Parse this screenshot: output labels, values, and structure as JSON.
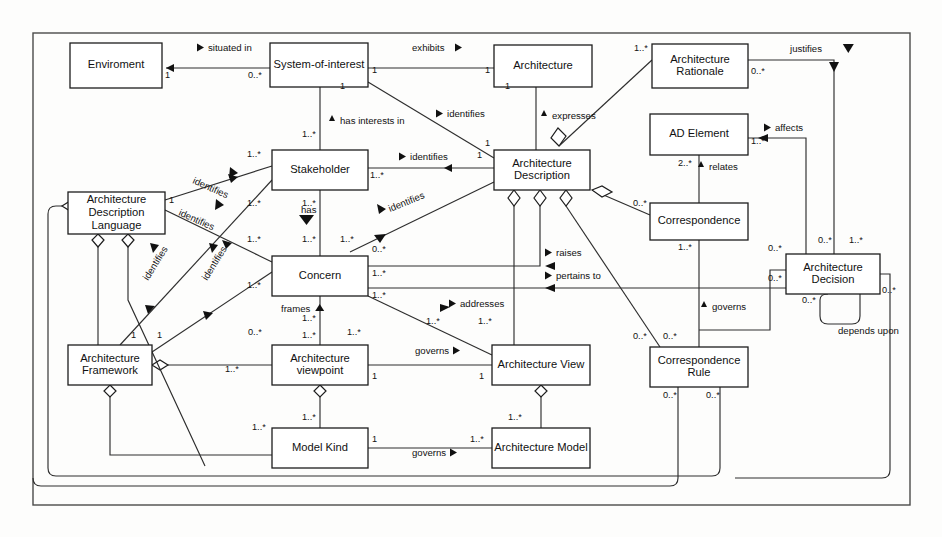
{
  "diagram": {
    "type": "uml-class-diagram",
    "frame": {
      "x": 33,
      "y": 33,
      "width": 877,
      "height": 472
    },
    "nodes": [
      {
        "id": "environment",
        "label": "Enviroment",
        "x": 70,
        "y": 43,
        "w": 92,
        "h": 45
      },
      {
        "id": "soi",
        "label": "System-of-interest",
        "x": 270,
        "y": 43,
        "w": 98,
        "h": 44
      },
      {
        "id": "architecture",
        "label": "Architecture",
        "x": 494,
        "y": 45,
        "w": 98,
        "h": 42
      },
      {
        "id": "arch-rationale",
        "label": "Architecture\nRationale",
        "x": 652,
        "y": 44,
        "w": 96,
        "h": 44
      },
      {
        "id": "ad-element",
        "label": "AD Element",
        "x": 650,
        "y": 114,
        "w": 98,
        "h": 41
      },
      {
        "id": "stakeholder",
        "label": "Stakeholder",
        "x": 272,
        "y": 150,
        "w": 96,
        "h": 40
      },
      {
        "id": "arch-description",
        "label": "Architecture\nDescription",
        "x": 494,
        "y": 150,
        "w": 96,
        "h": 40
      },
      {
        "id": "adl",
        "label": "Architecture\nDescription\nLanguage",
        "x": 68,
        "y": 192,
        "w": 97,
        "h": 42
      },
      {
        "id": "correspondence",
        "label": "Correspondence",
        "x": 650,
        "y": 203,
        "w": 98,
        "h": 37
      },
      {
        "id": "concern",
        "label": "Concern",
        "x": 272,
        "y": 256,
        "w": 96,
        "h": 40
      },
      {
        "id": "arch-decision",
        "label": "Architecture\nDecision",
        "x": 786,
        "y": 254,
        "w": 94,
        "h": 40
      },
      {
        "id": "arch-framework",
        "label": "Architecture\nFramework",
        "x": 68,
        "y": 345,
        "w": 84,
        "h": 40
      },
      {
        "id": "arch-viewpoint",
        "label": "Architecture\nviewpoint",
        "x": 272,
        "y": 345,
        "w": 96,
        "h": 40
      },
      {
        "id": "arch-view",
        "label": "Architecture View",
        "x": 492,
        "y": 345,
        "w": 98,
        "h": 40
      },
      {
        "id": "corr-rule",
        "label": "Correspondence\nRule",
        "x": 650,
        "y": 347,
        "w": 98,
        "h": 40
      },
      {
        "id": "model-kind",
        "label": "Model Kind",
        "x": 272,
        "y": 428,
        "w": 96,
        "h": 40
      },
      {
        "id": "arch-model",
        "label": "Architecture Model",
        "x": 492,
        "y": 428,
        "w": 98,
        "h": 40
      }
    ],
    "association_labels": [
      {
        "id": "situated-in",
        "text": "situated in",
        "x": 208,
        "y": 51,
        "marker": "left"
      },
      {
        "id": "exhibits",
        "text": "exhibits",
        "x": 412,
        "y": 51,
        "marker": "right"
      },
      {
        "id": "justifies",
        "text": "justifies",
        "x": 790,
        "y": 52,
        "marker": "down"
      },
      {
        "id": "identifies-soi-ad",
        "text": "identifies",
        "x": 447,
        "y": 117,
        "marker": "left"
      },
      {
        "id": "expresses",
        "text": "expresses",
        "x": 552,
        "y": 119,
        "marker": "up"
      },
      {
        "id": "affects",
        "text": "affects",
        "x": 775,
        "y": 131,
        "marker": "left"
      },
      {
        "id": "has-interests-in",
        "text": "has interests in",
        "x": 340,
        "y": 124,
        "marker": "up"
      },
      {
        "id": "identifies-sh-ad",
        "text": "identifies",
        "x": 410,
        "y": 160,
        "marker": "left"
      },
      {
        "id": "identifies-adl-sh",
        "text": "identifies",
        "x": 192,
        "y": 183,
        "marker": "rightdiag"
      },
      {
        "id": "relates",
        "text": "relates",
        "x": 709,
        "y": 170,
        "marker": "up"
      },
      {
        "id": "identifies-adl-cn",
        "text": "identifies",
        "x": 178,
        "y": 215,
        "marker": "rightdiag"
      },
      {
        "id": "has",
        "text": "has",
        "x": 301,
        "y": 213,
        "marker": "downfat"
      },
      {
        "id": "identifies-ad-cn",
        "text": "identifies",
        "x": 390,
        "y": 212,
        "marker": "leftdiag"
      },
      {
        "id": "raises",
        "text": "raises",
        "x": 556,
        "y": 256,
        "marker": "left"
      },
      {
        "id": "pertains-to",
        "text": "pertains to",
        "x": 556,
        "y": 279,
        "marker": "left"
      },
      {
        "id": "identifies-af-1",
        "text": "identifies",
        "x": 148,
        "y": 281,
        "marker": "updiag"
      },
      {
        "id": "identifies-af-2",
        "text": "identifies",
        "x": 207,
        "y": 281,
        "marker": "updiag"
      },
      {
        "id": "addresses",
        "text": "addresses",
        "x": 460,
        "y": 307,
        "marker": "left"
      },
      {
        "id": "frames",
        "text": "frames",
        "x": 281,
        "y": 312,
        "marker": "upfat"
      },
      {
        "id": "governs-cr",
        "text": "governs",
        "x": 712,
        "y": 310,
        "marker": "up"
      },
      {
        "id": "governs-vp-view",
        "text": "governs",
        "x": 415,
        "y": 354,
        "marker": "right"
      },
      {
        "id": "governs-mk-am",
        "text": "governs",
        "x": 412,
        "y": 456,
        "marker": "right"
      },
      {
        "id": "depends-upon",
        "text": "depends upon",
        "x": 838,
        "y": 334,
        "marker": "none"
      }
    ],
    "multiplicities": [
      {
        "text": "1",
        "x": 165,
        "y": 78
      },
      {
        "text": "0..*",
        "x": 248,
        "y": 78
      },
      {
        "text": "1",
        "x": 372,
        "y": 73
      },
      {
        "text": "1",
        "x": 485,
        "y": 73
      },
      {
        "text": "1..*",
        "x": 634,
        "y": 51
      },
      {
        "text": "0..*",
        "x": 751,
        "y": 74
      },
      {
        "text": "1",
        "x": 340,
        "y": 89
      },
      {
        "text": "1",
        "x": 485,
        "y": 146
      },
      {
        "text": "1",
        "x": 505,
        "y": 89
      },
      {
        "text": "1..*",
        "x": 302,
        "y": 137
      },
      {
        "text": "1..*",
        "x": 247,
        "y": 157
      },
      {
        "text": "1",
        "x": 477,
        "y": 158
      },
      {
        "text": "1..*",
        "x": 370,
        "y": 178
      },
      {
        "text": "1",
        "x": 169,
        "y": 203
      },
      {
        "text": "1..*",
        "x": 247,
        "y": 206
      },
      {
        "text": "1..*",
        "x": 302,
        "y": 206
      },
      {
        "text": "1..*",
        "x": 751,
        "y": 144
      },
      {
        "text": "2..*",
        "x": 678,
        "y": 166
      },
      {
        "text": "1..*",
        "x": 247,
        "y": 242
      },
      {
        "text": "1..*",
        "x": 302,
        "y": 242
      },
      {
        "text": "1..*",
        "x": 340,
        "y": 242
      },
      {
        "text": "0..*",
        "x": 372,
        "y": 252
      },
      {
        "text": "0..*",
        "x": 633,
        "y": 206
      },
      {
        "text": "1..*",
        "x": 678,
        "y": 250
      },
      {
        "text": "0..*",
        "x": 768,
        "y": 251
      },
      {
        "text": "0..*",
        "x": 818,
        "y": 243
      },
      {
        "text": "1..*",
        "x": 849,
        "y": 243
      },
      {
        "text": "0..*",
        "x": 768,
        "y": 281
      },
      {
        "text": "0..*",
        "x": 802,
        "y": 303
      },
      {
        "text": "0..*",
        "x": 882,
        "y": 293
      },
      {
        "text": "1..*",
        "x": 372,
        "y": 276
      },
      {
        "text": "1..*",
        "x": 372,
        "y": 298
      },
      {
        "text": "1..*",
        "x": 247,
        "y": 288
      },
      {
        "text": "1..*",
        "x": 302,
        "y": 321
      },
      {
        "text": "1..*",
        "x": 426,
        "y": 324
      },
      {
        "text": "1..*",
        "x": 478,
        "y": 324
      },
      {
        "text": "0..*",
        "x": 248,
        "y": 335
      },
      {
        "text": "1",
        "x": 131,
        "y": 338
      },
      {
        "text": "1",
        "x": 157,
        "y": 338
      },
      {
        "text": "1..*",
        "x": 302,
        "y": 338
      },
      {
        "text": "1..*",
        "x": 347,
        "y": 335
      },
      {
        "text": "1..*",
        "x": 225,
        "y": 372
      },
      {
        "text": "1",
        "x": 372,
        "y": 379
      },
      {
        "text": "1",
        "x": 479,
        "y": 379
      },
      {
        "text": "0..*",
        "x": 633,
        "y": 339
      },
      {
        "text": "0..*",
        "x": 663,
        "y": 339
      },
      {
        "text": "0..*",
        "x": 663,
        "y": 398
      },
      {
        "text": "0..*",
        "x": 706,
        "y": 398
      },
      {
        "text": "1..*",
        "x": 252,
        "y": 430
      },
      {
        "text": "1..*",
        "x": 302,
        "y": 420
      },
      {
        "text": "1",
        "x": 372,
        "y": 442
      },
      {
        "text": "1..*",
        "x": 470,
        "y": 442
      },
      {
        "text": "1..*",
        "x": 508,
        "y": 420
      }
    ],
    "colors": {
      "box_stroke": "#1d1d1d",
      "box_fill": "#ffffff",
      "edge": "#2e2e2e",
      "text": "#111111",
      "frame": "#4a4a4a",
      "background": "#fdfdfc"
    }
  }
}
